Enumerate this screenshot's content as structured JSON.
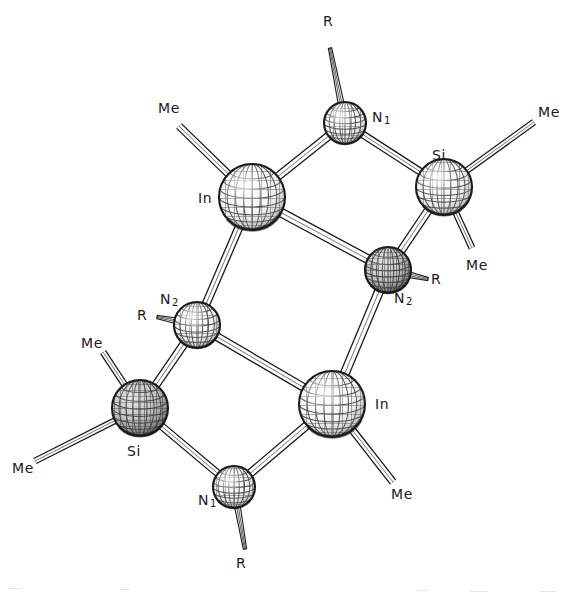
{
  "figure": {
    "kind": "ortep-molecular-structure",
    "background_color": "#fefefe",
    "line_color": "#1a1a1a",
    "sphere_fill_light": "#f2f2f2",
    "sphere_fill_dark": "#8a8a8a"
  },
  "atoms": [
    {
      "id": "In-top-left",
      "element": "In",
      "label": "In",
      "sub": "",
      "cx": 252,
      "cy": 197,
      "r": 33,
      "shade": "light",
      "label_x": 198,
      "label_y": 191
    },
    {
      "id": "N1-top",
      "element": "N",
      "label": "N",
      "sub": "1",
      "cx": 345,
      "cy": 123,
      "r": 21,
      "shade": "light",
      "label_x": 372,
      "label_y": 110
    },
    {
      "id": "Si-top-right",
      "element": "Si",
      "label": "Si",
      "sub": "",
      "cx": 444,
      "cy": 187,
      "r": 28,
      "shade": "light",
      "label_x": 432,
      "label_y": 148
    },
    {
      "id": "N2-right",
      "element": "N",
      "label": "N",
      "sub": "2",
      "cx": 388,
      "cy": 270,
      "r": 23,
      "shade": "dark",
      "label_x": 394,
      "label_y": 291
    },
    {
      "id": "N2-left",
      "element": "N",
      "label": "N",
      "sub": "2",
      "cx": 197,
      "cy": 325,
      "r": 23,
      "shade": "light",
      "label_x": 160,
      "label_y": 292
    },
    {
      "id": "Si-bottom-left",
      "element": "Si",
      "label": "Si",
      "sub": "",
      "cx": 140,
      "cy": 408,
      "r": 28,
      "shade": "dark",
      "label_x": 127,
      "label_y": 444
    },
    {
      "id": "In-bottom-right",
      "element": "In",
      "label": "In",
      "sub": "",
      "cx": 332,
      "cy": 404,
      "r": 33,
      "shade": "light",
      "label_x": 375,
      "label_y": 397
    },
    {
      "id": "N1-bottom",
      "element": "N",
      "label": "N",
      "sub": "1",
      "cx": 234,
      "cy": 487,
      "r": 21,
      "shade": "light",
      "label_x": 198,
      "label_y": 493
    }
  ],
  "cage_bonds": [
    {
      "from": "In-top-left",
      "to": "N1-top",
      "width": 9
    },
    {
      "from": "N1-top",
      "to": "Si-top-right",
      "width": 8
    },
    {
      "from": "Si-top-right",
      "to": "N2-right",
      "width": 9
    },
    {
      "from": "N2-right",
      "to": "In-top-left",
      "width": 10
    },
    {
      "from": "In-top-left",
      "to": "N2-left",
      "width": 9
    },
    {
      "from": "N2-right",
      "to": "In-bottom-right",
      "width": 10
    },
    {
      "from": "N2-left",
      "to": "Si-bottom-left",
      "width": 9
    },
    {
      "from": "N2-left",
      "to": "In-bottom-right",
      "width": 9
    },
    {
      "from": "Si-bottom-left",
      "to": "N1-bottom",
      "width": 8
    },
    {
      "from": "N1-bottom",
      "to": "In-bottom-right",
      "width": 9
    }
  ],
  "substituents": [
    {
      "id": "R-top",
      "label": "R",
      "on": "N1-top",
      "x2": 330,
      "y2": 48,
      "width": 6,
      "label_x": 323,
      "label_y": 14,
      "style": "striped"
    },
    {
      "id": "Me-upper-left",
      "label": "Me",
      "on": "In-top-left",
      "x2": 179,
      "y2": 126,
      "width": 8,
      "label_x": 158,
      "label_y": 101,
      "style": "open"
    },
    {
      "id": "Me-right-up",
      "label": "Me",
      "on": "Si-top-right",
      "x2": 534,
      "y2": 122,
      "width": 7,
      "label_x": 538,
      "label_y": 105,
      "style": "open"
    },
    {
      "id": "Me-right-down",
      "label": "Me",
      "on": "Si-top-right",
      "x2": 472,
      "y2": 248,
      "width": 7,
      "label_x": 466,
      "label_y": 258,
      "style": "open"
    },
    {
      "id": "R-right",
      "label": "R",
      "on": "N2-right",
      "x2": 428,
      "y2": 279,
      "width": 6,
      "label_x": 431,
      "label_y": 272,
      "style": "striped"
    },
    {
      "id": "R-left",
      "label": "R",
      "on": "N2-left",
      "x2": 157,
      "y2": 317,
      "width": 6,
      "label_x": 137,
      "label_y": 308,
      "style": "striped"
    },
    {
      "id": "Me-si-upper",
      "label": "Me",
      "on": "Si-bottom-left",
      "x2": 103,
      "y2": 352,
      "width": 7,
      "label_x": 81,
      "label_y": 336,
      "style": "open"
    },
    {
      "id": "Me-si-left",
      "label": "Me",
      "on": "Si-bottom-left",
      "x2": 35,
      "y2": 461,
      "width": 7,
      "label_x": 12,
      "label_y": 461,
      "style": "open"
    },
    {
      "id": "Me-in-lower",
      "label": "Me",
      "on": "In-bottom-right",
      "x2": 393,
      "y2": 482,
      "width": 8,
      "label_x": 391,
      "label_y": 487,
      "style": "open"
    },
    {
      "id": "R-bottom",
      "label": "R",
      "on": "N1-bottom",
      "x2": 245,
      "y2": 549,
      "width": 6,
      "label_x": 236,
      "label_y": 556,
      "style": "striped"
    }
  ]
}
